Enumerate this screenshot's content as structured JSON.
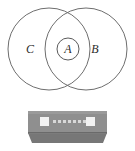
{
  "figure": {
    "type": "venn-diagram-with-device",
    "background_color": "#ffffff",
    "stroke_color": "#6e6e6e",
    "label_color": "#2b2b2b"
  },
  "venn": {
    "name": "venn-diagram",
    "circles": [
      {
        "id": "C",
        "label": "C",
        "cx": 49,
        "cy": 49,
        "r": 41,
        "label_x": 30,
        "label_y": 49
      },
      {
        "id": "B",
        "label": "B",
        "cx": 86,
        "cy": 49,
        "r": 41,
        "label_x": 95,
        "label_y": 49
      }
    ],
    "inner": {
      "id": "A",
      "label": "A",
      "cx": 68,
      "cy": 49,
      "r": 11,
      "label_x": 68,
      "label_y": 49
    },
    "labels": {
      "left": "C",
      "center": "A",
      "right": "B"
    }
  },
  "device": {
    "name": "network-switch",
    "body_color": "#8f8f8f",
    "front_color": "#777777",
    "top_color": "#9a9a9a",
    "edge_color": "#6a6a6a",
    "led_color": "#f2f2f2",
    "dot_color": "#d8d8d8",
    "leds": [
      {
        "id": "led-left",
        "x": 40,
        "y": 18,
        "w": 9,
        "h": 9
      },
      {
        "id": "led-right",
        "x": 86,
        "y": 18,
        "w": 9,
        "h": 9
      }
    ],
    "indicator_dots": [
      {
        "id": "dot-1",
        "x": 53,
        "y": 21
      },
      {
        "id": "dot-2",
        "x": 58,
        "y": 21
      },
      {
        "id": "dot-3",
        "x": 63,
        "y": 21
      },
      {
        "id": "dot-4",
        "x": 68,
        "y": 21
      },
      {
        "id": "dot-5",
        "x": 73,
        "y": 21
      },
      {
        "id": "dot-6",
        "x": 78,
        "y": 21
      },
      {
        "id": "dot-7",
        "x": 83,
        "y": 21
      }
    ],
    "dot_count": 7,
    "geometry": {
      "top_y": 11,
      "bottom_y": 34,
      "left_x": 28,
      "right_x": 107,
      "front_bottom_y": 42,
      "front_left_x": 32,
      "front_right_x": 103
    }
  }
}
